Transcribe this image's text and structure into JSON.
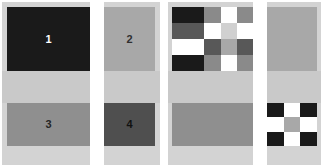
{
  "figure": {
    "background_color": "#ffffff",
    "width": 323,
    "height": 167
  },
  "palette": {
    "white": "#ffffff",
    "pale_gray": "#d3d3d3",
    "light_gray": "#c9c9c9",
    "medium_gray": "#9a9a9a",
    "mid_dark_gray": "#7a7a7a",
    "dark_gray": "#565656",
    "very_dark_gray": "#3a3a3a",
    "near_black": "#1a1a1a",
    "black": "#141414"
  },
  "panels": [
    {
      "id": "left-panel",
      "name": "uniform-quadrant-panel",
      "frame_color": "#d3d3d3",
      "band_color": "#c9c9c9",
      "gutter_color": "#ffffff",
      "quadrants": [
        {
          "id": "quad-1",
          "label": "1",
          "fill": "#1a1a1a",
          "label_color": "#ffffff",
          "position": "top-left"
        },
        {
          "id": "quad-2",
          "label": "2",
          "fill": "#a8a8a8",
          "label_color": "#303030",
          "position": "top-right"
        },
        {
          "id": "quad-3",
          "label": "3",
          "fill": "#8f8f8f",
          "label_color": "#262626",
          "position": "bottom-left"
        },
        {
          "id": "quad-4",
          "label": "4",
          "fill": "#4f4f4f",
          "label_color": "#111111",
          "position": "bottom-right"
        }
      ]
    },
    {
      "id": "right-panel",
      "name": "checkerboard-quadrant-panel",
      "frame_color": "#d3d3d3",
      "band_color": "#c9c9c9",
      "gutter_color": "#ffffff",
      "quadrants": [
        {
          "id": "quad-1-checker",
          "label": "",
          "position": "top-left",
          "type": "checkerboard",
          "columns": 5,
          "rows": 4,
          "cells": [
            "#1a1a1a",
            "#1a1a1a",
            "#8a8a8a",
            "#ffffff",
            "#8a8a8a",
            "#585858",
            "#585858",
            "#ffffff",
            "#d0d0d0",
            "#ffffff",
            "#ffffff",
            "#ffffff",
            "#585858",
            "#a8a8a8",
            "#585858",
            "#1a1a1a",
            "#1a1a1a",
            "#8a8a8a",
            "#ffffff",
            "#8a8a8a"
          ]
        },
        {
          "id": "quad-2-solid",
          "label": "",
          "position": "top-right",
          "type": "solid",
          "fill": "#a8a8a8"
        },
        {
          "id": "quad-3-solid",
          "label": "",
          "position": "bottom-left",
          "type": "solid",
          "fill": "#8f8f8f"
        },
        {
          "id": "quad-4-checker",
          "label": "",
          "position": "bottom-right",
          "type": "checkerboard",
          "columns": 3,
          "rows": 3,
          "cells": [
            "#1a1a1a",
            "#ffffff",
            "#1a1a1a",
            "#ffffff",
            "#a8a8a8",
            "#ffffff",
            "#1a1a1a",
            "#ffffff",
            "#1a1a1a"
          ]
        }
      ]
    }
  ]
}
